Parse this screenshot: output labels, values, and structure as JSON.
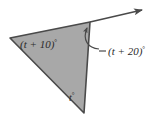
{
  "figure": {
    "type": "geometry-diagram",
    "background_color": "#ffffff",
    "fill_color": "#a8a8a8",
    "stroke_color": "#4a4a4a",
    "text_color": "#2b2b2b",
    "triangle": {
      "vertices": [
        {
          "name": "left-vertex",
          "x": 10,
          "y": 38
        },
        {
          "name": "top-vertex",
          "x": 90,
          "y": 22
        },
        {
          "name": "bottom-vertex",
          "x": 84,
          "y": 113
        }
      ]
    },
    "ray": {
      "name": "exterior-ray",
      "from_x": 90,
      "from_y": 22,
      "to_x": 146,
      "to_y": 9,
      "has_arrowhead": true
    },
    "leader_line": {
      "name": "leader-line",
      "from_x": 88,
      "from_y": 52,
      "to_x": 99,
      "to_y": 52
    },
    "curved_arrow": {
      "name": "angle-indicator-arc",
      "description": "curved arrow from label sweeping up to top vertex angle"
    },
    "labels": {
      "left_angle": "(t + 10)",
      "left_angle_degree": "°",
      "right_angle": "(t + 20)",
      "right_angle_degree": "°",
      "bottom_angle": "t",
      "bottom_angle_degree": "°"
    }
  }
}
